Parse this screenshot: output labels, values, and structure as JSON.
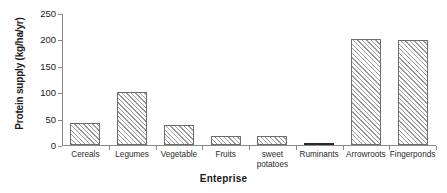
{
  "chart_data": {
    "type": "bar",
    "title": "",
    "xlabel": "Enteprise",
    "ylabel": "Protein supply (kg/ha/yr)",
    "categories": [
      "Cereals",
      "Legumes",
      "Vegetable",
      "Fruits",
      "sweet potatoes",
      "Ruminants",
      "Arrowroots",
      "Fingerponds"
    ],
    "values": [
      42,
      101,
      37,
      18,
      17,
      2,
      201,
      198
    ],
    "ylim": [
      0,
      250
    ],
    "ytick_labels": [
      "0",
      "50",
      "100",
      "150",
      "200",
      "250"
    ],
    "ytick_values": [
      0,
      50,
      100,
      150,
      200,
      250
    ],
    "grid": false,
    "legend": false,
    "bar_fill": "diagonal-hatch",
    "colors": {
      "bar_edge": "#6d6d6d",
      "bar_hatch": "#9b9b9b",
      "axis": "#8a8a8a",
      "text": "#1a1a1a",
      "background": "#ffffff"
    }
  }
}
